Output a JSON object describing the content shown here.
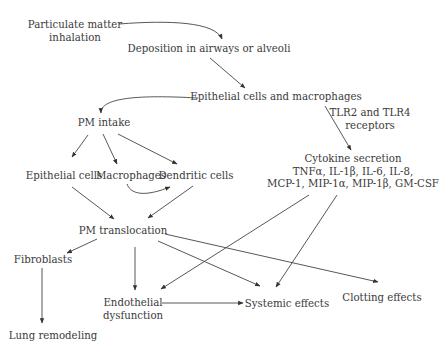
{
  "diagram": {
    "nodes": {
      "pm_inhalation": {
        "line1": "Particulate matter",
        "line2": "inhalation"
      },
      "deposition": {
        "label": "Deposition in airways or alveoli"
      },
      "epithelial_macrophages": {
        "label": "Epithelial cells and macrophages"
      },
      "tlr": {
        "line1": "TLR2 and TLR4",
        "line2": "receptors"
      },
      "pm_intake": {
        "label": "PM intake"
      },
      "epithelial_cells": {
        "label": "Epithelial cells"
      },
      "macrophages": {
        "label": "Macrophages"
      },
      "dendritic_cells": {
        "label": "Dendritic cells"
      },
      "cytokine": {
        "line1": "Cytokine secretion",
        "line2": "TNFα, IL-1β, IL-6, IL-8,",
        "line3": "MCP-1, MIP-1α, MIP-1β, GM-CSF"
      },
      "pm_translocation": {
        "label": "PM translocation"
      },
      "fibroblasts": {
        "label": "Fibroblasts"
      },
      "endothelial": {
        "line1": "Endothelial",
        "line2": "dysfunction"
      },
      "systemic": {
        "label": "Systemic effects"
      },
      "clotting": {
        "label": "Clotting effects"
      },
      "lung_remodeling": {
        "label": "Lung remodeling"
      }
    },
    "edges": [
      {
        "from": "Particulate matter inhalation",
        "to": "Deposition in airways or alveoli",
        "style": "curved"
      },
      {
        "from": "Deposition in airways or alveoli",
        "to": "Epithelial cells and macrophages"
      },
      {
        "from": "Epithelial cells and macrophages",
        "to": "PM intake",
        "style": "curved"
      },
      {
        "from": "Epithelial cells and macrophages",
        "to": "Cytokine secretion",
        "label": "TLR2 and TLR4 receptors"
      },
      {
        "from": "PM intake",
        "to": "Epithelial cells"
      },
      {
        "from": "PM intake",
        "to": "Macrophages"
      },
      {
        "from": "PM intake",
        "to": "Dendritic cells"
      },
      {
        "from": "Macrophages",
        "to": "Dendritic cells",
        "style": "curved"
      },
      {
        "from": "Epithelial cells",
        "to": "PM translocation"
      },
      {
        "from": "Dendritic cells",
        "to": "PM translocation"
      },
      {
        "from": "PM translocation",
        "to": "Fibroblasts"
      },
      {
        "from": "PM translocation",
        "to": "Endothelial dysfunction"
      },
      {
        "from": "PM translocation",
        "to": "Systemic effects"
      },
      {
        "from": "PM translocation",
        "to": "Clotting effects"
      },
      {
        "from": "Cytokine secretion",
        "to": "Endothelial dysfunction"
      },
      {
        "from": "Cytokine secretion",
        "to": "Systemic effects"
      },
      {
        "from": "Fibroblasts",
        "to": "Lung remodeling"
      },
      {
        "from": "Endothelial dysfunction",
        "to": "Systemic effects"
      }
    ]
  }
}
